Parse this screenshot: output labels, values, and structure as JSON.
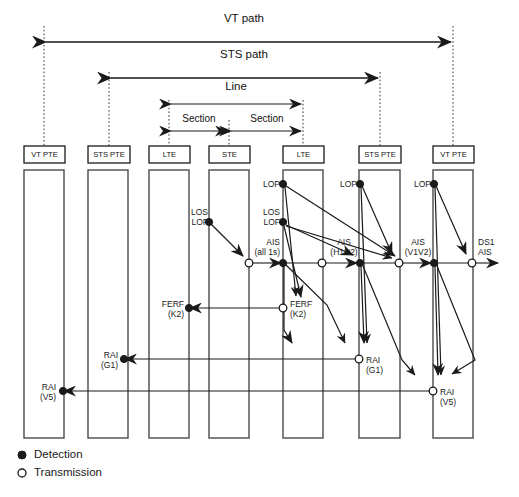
{
  "figure": {
    "legend": [
      {
        "marker": "filled-circle",
        "label": "Detection"
      },
      {
        "marker": "open-circle",
        "label": "Transmission"
      }
    ],
    "span_labels": [
      {
        "id": "vt-path",
        "label": "VT path"
      },
      {
        "id": "sts-path",
        "label": "STS path"
      },
      {
        "id": "line",
        "label": "Line"
      },
      {
        "id": "section-left",
        "label": "Section"
      },
      {
        "id": "section-right",
        "label": "Section"
      }
    ],
    "equipment": [
      {
        "id": "col1",
        "label": "VT PTE"
      },
      {
        "id": "col2",
        "label": "STS PTE"
      },
      {
        "id": "col3",
        "label": "LTE"
      },
      {
        "id": "col4",
        "label": "STE"
      },
      {
        "id": "col5",
        "label": "LTE"
      },
      {
        "id": "col6",
        "label": "STS PTE"
      },
      {
        "id": "col7",
        "label": "VT PTE"
      }
    ],
    "annotations": [
      {
        "id": "los-lof-col4",
        "line1": "LOS",
        "line2": "LOF",
        "type": "detection"
      },
      {
        "id": "lop-col5",
        "line1": "LOP",
        "line2": "",
        "type": "detection"
      },
      {
        "id": "los-lof-col5",
        "line1": "LOS",
        "line2": "LOF",
        "type": "detection"
      },
      {
        "id": "ais-all1s",
        "line1": "AIS",
        "line2": "(all 1s)",
        "type": "signal"
      },
      {
        "id": "lop-col6",
        "line1": "LOP",
        "line2": "",
        "type": "detection"
      },
      {
        "id": "ais-h1h2",
        "line1": "AIS",
        "line2": "(H1H2)",
        "type": "signal"
      },
      {
        "id": "lop-col7",
        "line1": "LOP",
        "line2": "",
        "type": "detection"
      },
      {
        "id": "ais-v1v2",
        "line1": "AIS",
        "line2": "(V1V2)",
        "type": "signal"
      },
      {
        "id": "ds1-ais",
        "line1": "DS1",
        "line2": "AIS",
        "type": "signal"
      },
      {
        "id": "ferf-k2-det",
        "line1": "FERF",
        "line2": "(K2)",
        "type": "detection"
      },
      {
        "id": "ferf-k2-tx",
        "line1": "FERF",
        "line2": "(K2)",
        "type": "transmission"
      },
      {
        "id": "rai-g1-det",
        "line1": "RAI",
        "line2": "(G1)",
        "type": "detection"
      },
      {
        "id": "rai-g1-tx",
        "line1": "RAI",
        "line2": "(G1)",
        "type": "transmission"
      },
      {
        "id": "rai-v5-det",
        "line1": "RAI",
        "line2": "(V5)",
        "type": "detection"
      },
      {
        "id": "rai-v5-tx",
        "line1": "RAI",
        "line2": "(V5)",
        "type": "transmission"
      }
    ],
    "colors": {
      "stroke": "#1a1a1a",
      "fill": "#ffffff",
      "background": "#ffffff"
    }
  }
}
